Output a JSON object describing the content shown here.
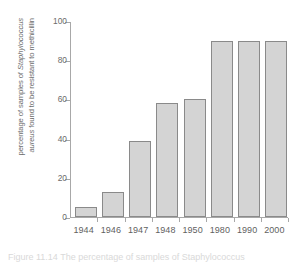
{
  "chart_data": {
    "type": "bar",
    "title": "",
    "xlabel": "",
    "ylabel_line_1": "percentage of samples of Staphylococcus",
    "ylabel_line_2": "aureus found to be resistant to methicillin",
    "ylabel_full": "percentage of samples of Staphylococcus aureus found to be resistant to methicillin",
    "ylabel_italic_part_1": "Staphylococcus",
    "ylabel_italic_part_2": "aureus",
    "ylabel_plain_1a": "percentage of samples of ",
    "ylabel_plain_2a": " found to be resistant to methicillin",
    "categories": [
      "1944",
      "1946",
      "1947",
      "1948",
      "1950",
      "1980",
      "1990",
      "2000"
    ],
    "values": [
      5,
      13,
      39,
      58,
      60,
      90,
      90,
      90
    ],
    "ylim": [
      0,
      100
    ],
    "yticks": [
      0,
      20,
      40,
      60,
      80,
      100
    ],
    "ytick_labels": [
      "0",
      "20",
      "40",
      "60",
      "80",
      "100"
    ],
    "grid": false,
    "legend": null,
    "bar_fill_color": "#d4d4d4",
    "bar_border_color": "#8a8a8a",
    "axis_color": "#a8a8a8",
    "text_color": "#6b6b6b",
    "background_color": "#ffffff"
  },
  "caption": {
    "text": "Figure 11.14  The percentage of samples of Staphylococcus"
  }
}
